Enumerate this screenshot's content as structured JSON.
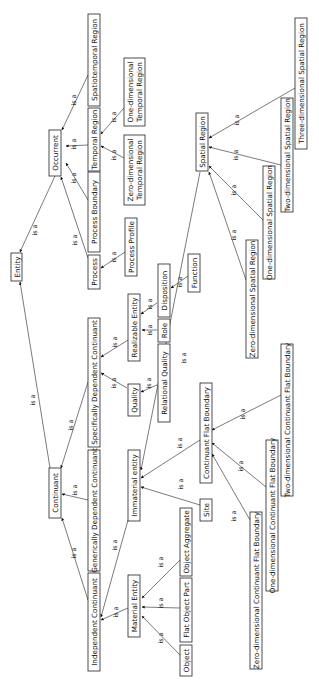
{
  "diagram": {
    "title": "",
    "edge_label": "is a",
    "nodes": {
      "entity": "Entity",
      "occurrent": "Occurrent",
      "continuant": "Continuant",
      "process": "Process",
      "process_boundary": "Process Boundary",
      "temporal_region": "Temporal Region",
      "spatiotemporal_region": "Spatiotemporal Region",
      "zero_dim_temporal_region_1": "Zero-dimensional",
      "zero_dim_temporal_region_2": "Temporal Region",
      "one_dim_temporal_region_1": "One-dimensional",
      "one_dim_temporal_region_2": "Temporal Region",
      "process_profile": "Process Profile",
      "independent_continuant": "Independent Continuant",
      "generically_dependent_continuant": "Generically Dependent Continuant",
      "specifically_dependent_continuant": "Specifically Dependent Continuant",
      "immaterial_entity": "Immaterial entity",
      "quality": "Quality",
      "relational_quality": "Relational Quality",
      "realizable_entity": "Realizable Entity",
      "role": "Role",
      "disposition": "Disposition",
      "function": "Function",
      "material_entity": "Material Entity",
      "object": "Object",
      "flat_object_part": "Flat Object Part",
      "object_aggregate": "Object Aggregate",
      "site": "Site",
      "continuant_flat_boundary": "Continuant Flat Boundary",
      "zero_dim_cfb": "Zero-dimensional Continuant Flat Boundary",
      "one_dim_cfb": "One-dimensional Continuant Flat Boundary",
      "two_dim_cfb": "Two-dimensional Continuant Flat Boundary",
      "spatial_region": "Spatial Region",
      "zero_dim_spatial_region": "Zero-dimensional Spatial Region",
      "one_dim_spatial_region": "One-dimensional Spatial Region",
      "two_dim_spatial_region": "Two-dimensional Spatial Region",
      "three_dim_spatial_region": "Three-dimensional Spatial Region"
    },
    "edges": [
      {
        "from": "Occurrent",
        "to": "Entity",
        "label": "is a"
      },
      {
        "from": "Continuant",
        "to": "Entity",
        "label": "is a"
      },
      {
        "from": "Process",
        "to": "Occurrent",
        "label": "is a"
      },
      {
        "from": "Process Boundary",
        "to": "Occurrent",
        "label": "is a"
      },
      {
        "from": "Temporal Region",
        "to": "Occurrent",
        "label": "is a"
      },
      {
        "from": "Spatiotemporal Region",
        "to": "Occurrent",
        "label": "is a"
      },
      {
        "from": "Zero-dimensional Temporal Region",
        "to": "Temporal Region",
        "label": "is a"
      },
      {
        "from": "One-dimensional Temporal Region",
        "to": "Temporal Region",
        "label": "is a"
      },
      {
        "from": "Process Profile",
        "to": "Process",
        "label": "is a"
      },
      {
        "from": "Independent Continuant",
        "to": "Continuant",
        "label": "is a"
      },
      {
        "from": "Generically Dependent Continuant",
        "to": "Continuant",
        "label": "is a"
      },
      {
        "from": "Specifically Dependent Continuant",
        "to": "Continuant",
        "label": "is a"
      },
      {
        "from": "Quality",
        "to": "Specifically Dependent Continuant",
        "label": "is a"
      },
      {
        "from": "Realizable Entity",
        "to": "Specifically Dependent Continuant",
        "label": "is a"
      },
      {
        "from": "Relational Quality",
        "to": "Quality",
        "label": "is a"
      },
      {
        "from": "Role",
        "to": "Realizable Entity",
        "label": "is a"
      },
      {
        "from": "Disposition",
        "to": "Realizable Entity",
        "label": "is a"
      },
      {
        "from": "Function",
        "to": "Disposition",
        "label": "is a"
      },
      {
        "from": "Material Entity",
        "to": "Independent Continuant",
        "label": "is a"
      },
      {
        "from": "Immaterial entity",
        "to": "Independent Continuant",
        "label": "is a"
      },
      {
        "from": "Object",
        "to": "Material Entity",
        "label": "is a"
      },
      {
        "from": "Flat Object Part",
        "to": "Material Entity",
        "label": "is a"
      },
      {
        "from": "Object Aggregate",
        "to": "Material Entity",
        "label": "is a"
      },
      {
        "from": "Site",
        "to": "Immaterial entity",
        "label": "is a"
      },
      {
        "from": "Continuant Flat Boundary",
        "to": "Immaterial entity",
        "label": "is a"
      },
      {
        "from": "Spatial Region",
        "to": "Immaterial entity",
        "label": "is a"
      },
      {
        "from": "Zero-dimensional Continuant Flat Boundary",
        "to": "Continuant Flat Boundary",
        "label": "is a"
      },
      {
        "from": "One-dimensional Continuant Flat Boundary",
        "to": "Continuant Flat Boundary",
        "label": "is a"
      },
      {
        "from": "Two-dimensional Continuant Flat Boundary",
        "to": "Continuant Flat Boundary",
        "label": "is a"
      },
      {
        "from": "Zero-dimensional Spatial Region",
        "to": "Spatial Region",
        "label": "is a"
      },
      {
        "from": "One-dimensional Spatial Region",
        "to": "Spatial Region",
        "label": "is a"
      },
      {
        "from": "Two-dimensional Spatial Region",
        "to": "Spatial Region",
        "label": "is a"
      },
      {
        "from": "Three-dimensional Spatial Region",
        "to": "Spatial Region",
        "label": "is a"
      }
    ]
  }
}
